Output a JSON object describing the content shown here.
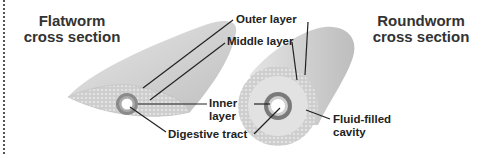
{
  "titles": {
    "flatworm_line1": "Flatworm",
    "flatworm_line2": "cross section",
    "roundworm_line1": "Roundworm",
    "roundworm_line2": "cross section"
  },
  "labels": {
    "outer_layer": "Outer layer",
    "middle_layer": "Middle layer",
    "inner_line1": "Inner",
    "inner_line2": "layer",
    "digestive_tract": "Digestive tract",
    "fluid_line1": "Fluid-filled",
    "fluid_line2": "cavity"
  },
  "colors": {
    "body_fill": "#d4d4d4",
    "middle_fill": "#c4c4c4",
    "inner_ring": "#7a7a7a",
    "leader_line": "#222222"
  }
}
